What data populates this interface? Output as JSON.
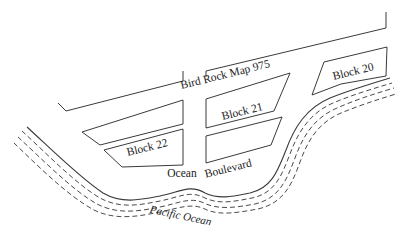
{
  "map": {
    "title": "Bird Rock Map 975",
    "blocks": [
      {
        "id": "block-20",
        "label": "Block 20"
      },
      {
        "id": "block-21",
        "label": "Block 21"
      },
      {
        "id": "block-22",
        "label": "Block 22"
      }
    ],
    "street": {
      "label_part1": "Ocean",
      "label_part2": "Boulevard"
    },
    "water": {
      "label": "Pacific Ocean"
    },
    "colors": {
      "line": "#3a3a3a",
      "background": "#ffffff"
    }
  }
}
